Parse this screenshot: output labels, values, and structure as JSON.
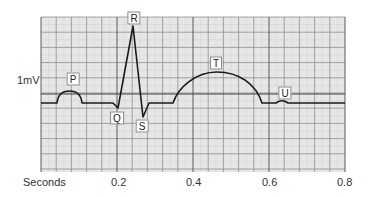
{
  "diagram": {
    "y_reference_label": "1mV",
    "x_axis": {
      "label": "Seconds",
      "ticks": [
        "0.2",
        "0.4",
        "0.6",
        "0.8"
      ]
    },
    "wave_labels": {
      "P": "P",
      "Q": "Q",
      "R": "R",
      "S": "S",
      "T": "T",
      "U": "U"
    },
    "colors": {
      "grid_bg": "#e6e6e6",
      "grid_minor": "#cfcfcf",
      "grid_major": "#8c8c8c",
      "grid_bold": "#555555",
      "trace": "#1a1a1a"
    }
  }
}
